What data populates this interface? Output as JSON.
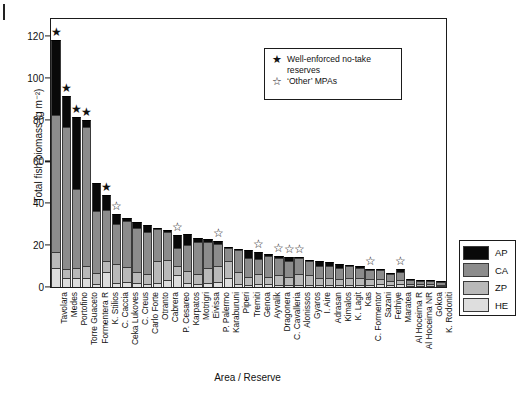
{
  "figure": {
    "page_edge_mark": true
  },
  "chart_data": {
    "type": "bar",
    "title": "",
    "subtitle": "",
    "xlabel": "Area / Reserve",
    "ylabel": "Total fish biomass (g m⁻²)",
    "ylim": [
      0,
      128
    ],
    "yticks": [
      0,
      20,
      40,
      60,
      80,
      100,
      120
    ],
    "ytick_labels": [
      "0",
      "20",
      "40",
      "60",
      "80",
      "100",
      "120"
    ],
    "grid": false,
    "stacked": true,
    "legend_position": "right-outside",
    "series": [
      {
        "name": "AP",
        "color": "#090909"
      },
      {
        "name": "CA",
        "color": "#8c8c8c"
      },
      {
        "name": "ZP",
        "color": "#b9b9b9"
      },
      {
        "name": "HE",
        "color": "#dedede"
      }
    ],
    "categories": [
      "Tavolara",
      "Medes",
      "Portofino",
      "Torre Guaceto",
      "Formentera R",
      "K. Stilios",
      "C. Caccia",
      "Ceka Lukoves",
      "C. Creus",
      "Carlo Forte",
      "Otranto",
      "Cabrera",
      "P. Cesareo",
      "Karpatos",
      "Motrigri",
      "Eivissa",
      "P. Palermo",
      "Karaburuni",
      "Piperi",
      "Tremiti",
      "Genoa",
      "Ayvalik",
      "Dragonera",
      "C. Cavalleria",
      "Alonissos",
      "Gyaros",
      "I. Aire",
      "Adrasan",
      "Kimalos",
      "K. Lagit",
      "Kas",
      "C. Formentor",
      "Sazani",
      "Fethiye",
      "Maratea",
      "Al Hoceima R",
      "Al Hoceima NR",
      "Gokoa",
      "K. Rodoniti"
    ],
    "stacks": [
      {
        "HE": 9.0,
        "ZP": 7.5,
        "CA": 65.5,
        "AP": 36.0
      },
      {
        "HE": 4.5,
        "ZP": 4.0,
        "CA": 68.0,
        "AP": 14.5
      },
      {
        "HE": 4.5,
        "ZP": 4.5,
        "CA": 38.0,
        "AP": 34.0
      },
      {
        "HE": 4.5,
        "ZP": 5.5,
        "CA": 66.5,
        "AP": 3.5
      },
      {
        "HE": 1.5,
        "ZP": 5.0,
        "CA": 30.0,
        "AP": 13.0
      },
      {
        "HE": 7.0,
        "ZP": 5.5,
        "CA": 24.5,
        "AP": 7.0
      },
      {
        "HE": 2.0,
        "ZP": 9.0,
        "CA": 19.0,
        "AP": 5.0
      },
      {
        "HE": 2.5,
        "ZP": 7.0,
        "CA": 22.0,
        "AP": 1.5
      },
      {
        "HE": 2.0,
        "ZP": 5.0,
        "CA": 21.0,
        "AP": 3.0
      },
      {
        "HE": 1.5,
        "ZP": 4.5,
        "CA": 20.5,
        "AP": 3.0
      },
      {
        "HE": 2.0,
        "ZP": 10.5,
        "CA": 15.0,
        "AP": 0.7
      },
      {
        "HE": 3.5,
        "ZP": 9.5,
        "CA": 13.5,
        "AP": 0.5
      },
      {
        "HE": 5.5,
        "ZP": 4.5,
        "CA": 8.5,
        "AP": 6.5
      },
      {
        "HE": 2.0,
        "ZP": 5.5,
        "CA": 12.5,
        "AP": 5.5
      },
      {
        "HE": 1.5,
        "ZP": 4.5,
        "CA": 15.5,
        "AP": 2.0
      },
      {
        "HE": 2.0,
        "ZP": 7.0,
        "CA": 12.5,
        "AP": 1.5
      },
      {
        "HE": 2.5,
        "ZP": 7.5,
        "CA": 10.5,
        "AP": 1.5
      },
      {
        "HE": 4.5,
        "ZP": 8.0,
        "CA": 6.0,
        "AP": 0.8
      },
      {
        "HE": 1.5,
        "ZP": 5.5,
        "CA": 10.5,
        "AP": 0.8
      },
      {
        "HE": 1.0,
        "ZP": 4.0,
        "CA": 9.0,
        "AP": 3.5
      },
      {
        "HE": 1.5,
        "ZP": 4.5,
        "CA": 7.5,
        "AP": 3.0
      },
      {
        "HE": 1.5,
        "ZP": 3.5,
        "CA": 10.0,
        "AP": 0.8
      },
      {
        "HE": 1.0,
        "ZP": 4.5,
        "CA": 8.5,
        "AP": 0.8
      },
      {
        "HE": 1.0,
        "ZP": 4.0,
        "CA": 7.5,
        "AP": 2.0
      },
      {
        "HE": 1.0,
        "ZP": 5.0,
        "CA": 8.0,
        "AP": 0.5
      },
      {
        "HE": 1.0,
        "ZP": 4.5,
        "CA": 7.0,
        "AP": 0.5
      },
      {
        "HE": 0.8,
        "ZP": 3.5,
        "CA": 5.5,
        "AP": 2.5
      },
      {
        "HE": 0.8,
        "ZP": 3.5,
        "CA": 5.5,
        "AP": 2.0
      },
      {
        "HE": 0.8,
        "ZP": 3.0,
        "CA": 5.5,
        "AP": 1.8
      },
      {
        "HE": 0.8,
        "ZP": 3.5,
        "CA": 5.5,
        "AP": 0.8
      },
      {
        "HE": 0.8,
        "ZP": 3.5,
        "CA": 5.0,
        "AP": 0.8
      },
      {
        "HE": 0.8,
        "ZP": 3.0,
        "CA": 4.5,
        "AP": 0.5
      },
      {
        "HE": 1.5,
        "ZP": 2.5,
        "CA": 4.0,
        "AP": 0.5
      },
      {
        "HE": 0.8,
        "ZP": 2.0,
        "CA": 3.5,
        "AP": 0.3
      },
      {
        "HE": 1.5,
        "ZP": 2.0,
        "CA": 3.5,
        "AP": 1.5
      },
      {
        "HE": 0.5,
        "ZP": 1.0,
        "CA": 2.0,
        "AP": 0.3
      },
      {
        "HE": 0.5,
        "ZP": 0.8,
        "CA": 1.8,
        "AP": 0.2
      },
      {
        "HE": 0.5,
        "ZP": 0.8,
        "CA": 1.8,
        "AP": 0.2
      },
      {
        "HE": 0.4,
        "ZP": 0.7,
        "CA": 1.5,
        "AP": 0.2
      }
    ],
    "markers": [
      {
        "index": 0,
        "type": "filled"
      },
      {
        "index": 1,
        "type": "filled"
      },
      {
        "index": 2,
        "type": "filled"
      },
      {
        "index": 3,
        "type": "filled"
      },
      {
        "index": 5,
        "type": "filled"
      },
      {
        "index": 6,
        "type": "open"
      },
      {
        "index": 12,
        "type": "open"
      },
      {
        "index": 16,
        "type": "open"
      },
      {
        "index": 20,
        "type": "open"
      },
      {
        "index": 22,
        "type": "open"
      },
      {
        "index": 23,
        "type": "open"
      },
      {
        "index": 24,
        "type": "open"
      },
      {
        "index": 31,
        "type": "open"
      },
      {
        "index": 34,
        "type": "open"
      }
    ]
  },
  "star_legend": {
    "rows": [
      {
        "glyph": "★",
        "label": "Well-enforced no-take reserves"
      },
      {
        "glyph": "☆",
        "label": "‘Other’ MPAs"
      }
    ]
  },
  "color_legend": {
    "rows": [
      {
        "label": "AP",
        "color": "#090909"
      },
      {
        "label": "CA",
        "color": "#8c8c8c"
      },
      {
        "label": "ZP",
        "color": "#b9b9b9"
      },
      {
        "label": "HE",
        "color": "#dedede"
      }
    ]
  }
}
